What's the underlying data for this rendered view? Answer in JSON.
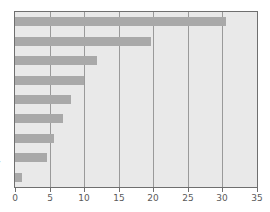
{
  "chart_data": {
    "type": "bar",
    "orientation": "horizontal",
    "title": "",
    "xlabel": "",
    "ylabel": "y",
    "xlim": [
      0,
      35
    ],
    "xticks": [
      0,
      5,
      10,
      15,
      20,
      25,
      30,
      35
    ],
    "xtick_labels": [
      "0",
      "5",
      "10",
      "15",
      "20",
      "25",
      "30",
      "35"
    ],
    "grid": true,
    "grid_axis": "x",
    "legend": false,
    "categories": [
      "",
      "",
      "",
      "",
      "",
      "",
      "",
      "",
      ""
    ],
    "values": [
      30.5,
      19.7,
      11.9,
      10.0,
      8.1,
      6.9,
      5.6,
      4.6,
      1.0
    ],
    "bar_color": "#a9a9a9",
    "plot_background": "#e9e9e9",
    "frame_color": "#6f6f6f",
    "grid_color": "#9a9a9a"
  },
  "axis": {
    "y_label_fragment": "y"
  }
}
